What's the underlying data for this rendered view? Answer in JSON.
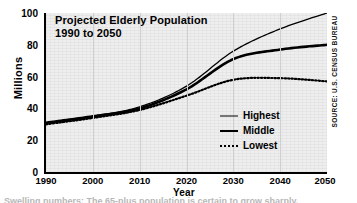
{
  "chart_data": {
    "type": "line",
    "title": "Projected Elderly Population",
    "subtitle": "1990 to 2050",
    "xlabel": "Year",
    "ylabel": "Millions",
    "source": "SOURCE: U.S. CENSUS BUREAU",
    "x": [
      1990,
      2000,
      2010,
      2020,
      2030,
      2040,
      2050
    ],
    "xlim": [
      1990,
      2050
    ],
    "ylim": [
      0,
      100
    ],
    "yticks": [
      0,
      20,
      40,
      60,
      80,
      100
    ],
    "xticks": [
      "1990",
      "2000",
      "2010",
      "2020",
      "2030",
      "2040",
      "2050"
    ],
    "grid": "vertical",
    "legend_position": "inside-right",
    "series": [
      {
        "name": "Highest",
        "style": "thin-solid",
        "values": [
          31,
          35,
          41,
          54,
          76,
          90,
          100
        ]
      },
      {
        "name": "Middle",
        "style": "thick-solid",
        "values": [
          31,
          35,
          40,
          52,
          71,
          77,
          80
        ]
      },
      {
        "name": "Lowest",
        "style": "dotted",
        "values": [
          30,
          34,
          39,
          48,
          58,
          59,
          57
        ]
      }
    ]
  },
  "legend": {
    "items": [
      {
        "label": "Highest"
      },
      {
        "label": "Middle"
      },
      {
        "label": "Lowest"
      }
    ]
  },
  "caption": {
    "text": "Swelling numbers: The 65-plus population is certain to grow sharply."
  }
}
